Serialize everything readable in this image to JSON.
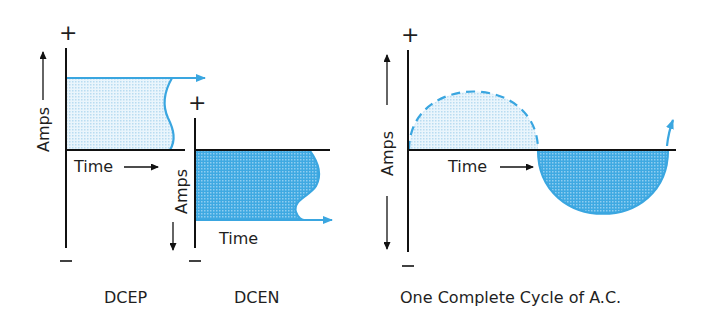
{
  "diagram": {
    "colors": {
      "blue_line": "#3aa6e0",
      "light_fill": "#dff0fa",
      "dark_fill": "#3eaae2",
      "axis": "#111111"
    },
    "panels": [
      {
        "id": "dcep",
        "caption": "DCEP",
        "plus": "+",
        "minus": "–",
        "y_label": "Amps",
        "x_label": "Time",
        "polarity": "positive"
      },
      {
        "id": "dcen",
        "caption": "DCEN",
        "plus": "+",
        "minus": "–",
        "y_label": "Amps",
        "x_label": "Time",
        "polarity": "negative"
      },
      {
        "id": "ac",
        "caption": "One Complete Cycle of A.C.",
        "plus": "+",
        "minus": "–",
        "y_label": "Amps",
        "x_label": "Time",
        "polarity": "alternating"
      }
    ]
  }
}
